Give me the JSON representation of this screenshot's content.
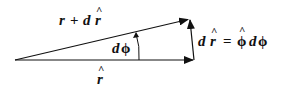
{
  "diagram": {
    "title": "",
    "colors": {
      "stroke": "#111111",
      "background": "#ffffff"
    },
    "vectors": [
      {
        "id": "r-hat",
        "from": [
          15,
          60
        ],
        "to": [
          194,
          60
        ],
        "label": "r̂"
      },
      {
        "id": "r-plus-dr",
        "from": [
          15,
          60
        ],
        "to": [
          189,
          19
        ],
        "label": "r + d r̂"
      },
      {
        "id": "d-r-hat",
        "from": [
          194,
          60
        ],
        "to": [
          190,
          19
        ],
        "label": "d r̂ = φ̂ dφ"
      }
    ],
    "angle": {
      "label": "dφ"
    },
    "labels": {
      "r_plus_dr": {
        "r": "r",
        "plus": "+",
        "d": "d",
        "r_hat": "r",
        "hat": "^"
      },
      "r_hat": {
        "r": "r",
        "hat": "^"
      },
      "d_phi": {
        "d": "d",
        "phi": "ϕ"
      },
      "equation": {
        "d": "d",
        "r": "r",
        "hat": "^",
        "eq": "=",
        "phi_hat": "ϕ",
        "d2": "d",
        "phi": "ϕ"
      }
    }
  }
}
